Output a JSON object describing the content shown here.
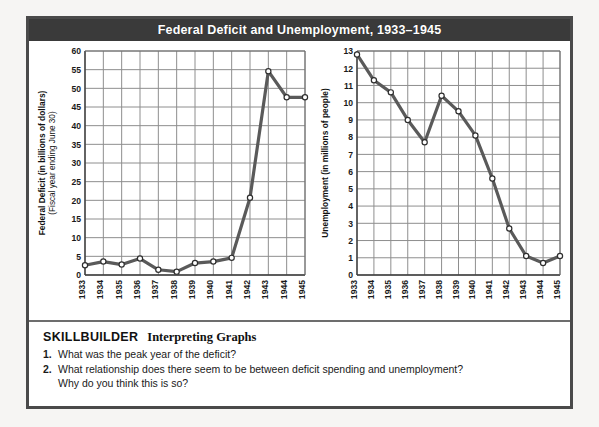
{
  "figure": {
    "title": "Federal Deficit and Unemployment, 1933–1945",
    "frame_color": "#4a4a4a",
    "title_bar_color": "#3a3a3a",
    "line_color": "#5a5a5a",
    "grid_color": "#8e8e8e",
    "marker_fill": "#ffffff"
  },
  "skillbuilder": {
    "heading": "SKILLBUILDER",
    "subheading": "Interpreting Graphs",
    "questions": [
      {
        "number": "1.",
        "text": "What was the peak year of the deficit?",
        "continuation": ""
      },
      {
        "number": "2.",
        "text": "What relationship does there seem to be between deficit spending and unemployment?",
        "continuation": "Why do you think this is so?"
      }
    ]
  },
  "chart_data": [
    {
      "type": "line",
      "id": "deficit",
      "title": "",
      "ylabel": "Federal Deficit (in billions of dollars)",
      "ylabel2": "(Fiscal year ending June 30)",
      "xlabel": "",
      "ylim": [
        0,
        60
      ],
      "yticks": [
        0,
        5,
        10,
        15,
        20,
        25,
        30,
        35,
        40,
        45,
        50,
        55,
        60
      ],
      "ytick_labels": [
        "0",
        "5",
        "10",
        "15",
        "20",
        "25",
        "30",
        "35",
        "40",
        "45",
        "50",
        "55",
        "60"
      ],
      "grid": true,
      "legend": "none",
      "categories": [
        "1933",
        "1934",
        "1935",
        "1936",
        "1937",
        "1938",
        "1939",
        "1940",
        "1941",
        "1942",
        "1943",
        "1944",
        "1945"
      ],
      "values": [
        2.6,
        3.6,
        2.8,
        4.4,
        1.4,
        0.9,
        3.2,
        3.6,
        4.6,
        20.7,
        54.6,
        47.6,
        47.6
      ]
    },
    {
      "type": "line",
      "id": "unemployment",
      "title": "",
      "ylabel": "Unemployment (in millions of people)",
      "xlabel": "",
      "ylim": [
        0,
        13
      ],
      "yticks": [
        0,
        1,
        2,
        3,
        4,
        5,
        6,
        7,
        8,
        9,
        10,
        11,
        12,
        13
      ],
      "ytick_labels": [
        "0",
        "1",
        "2",
        "3",
        "4",
        "5",
        "6",
        "7",
        "8",
        "9",
        "10",
        "11",
        "12",
        "13"
      ],
      "grid": true,
      "legend": "none",
      "categories": [
        "1933",
        "1934",
        "1935",
        "1936",
        "1937",
        "1938",
        "1939",
        "1940",
        "1941",
        "1942",
        "1943",
        "1944",
        "1945"
      ],
      "values": [
        12.8,
        11.3,
        10.6,
        9.0,
        7.7,
        10.4,
        9.5,
        8.1,
        5.6,
        2.7,
        1.1,
        0.7,
        1.1
      ]
    }
  ]
}
